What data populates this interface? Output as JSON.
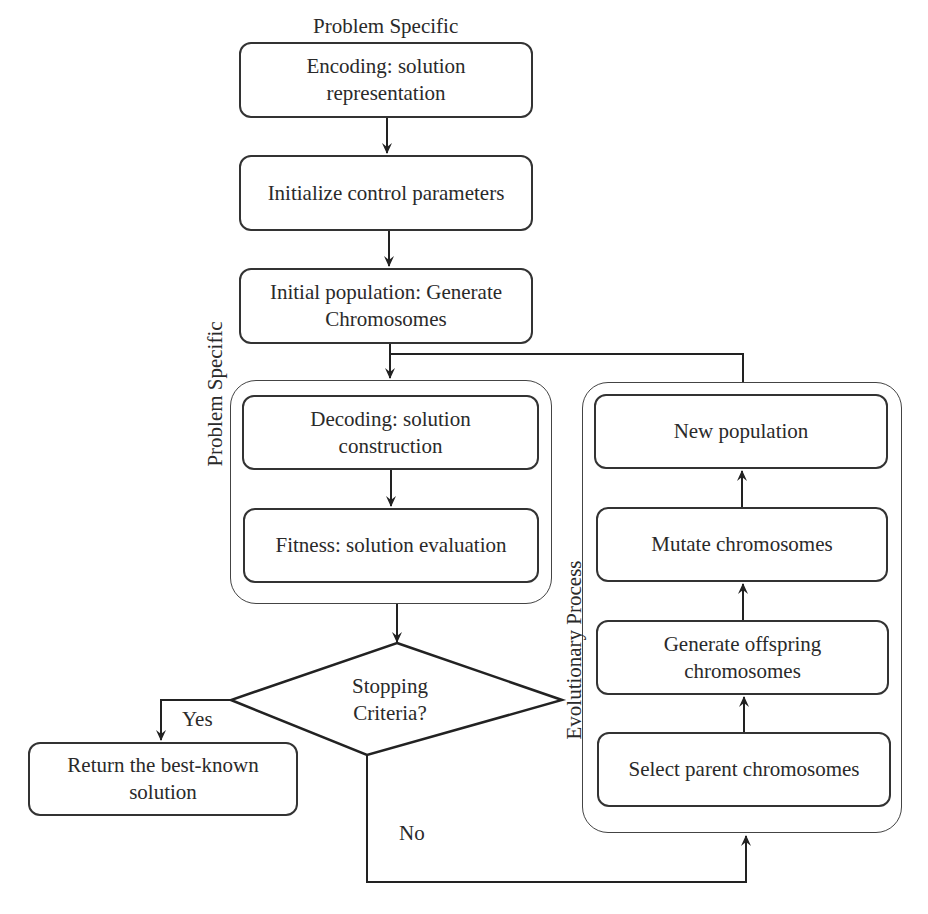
{
  "diagram": {
    "type": "flowchart",
    "title_label": "Problem Specific",
    "nodes": {
      "encoding": "Encoding: solution representation",
      "encoding_line1": "Encoding: solution",
      "encoding_line2": "representation",
      "initialize": "Initialize control parameters",
      "initial_population_line1": "Initial population: Generate",
      "initial_population_line2": "Chromosomes",
      "decoding_line1": "Decoding: solution",
      "decoding_line2": "construction",
      "fitness": "Fitness: solution evaluation",
      "decision_line1": "Stopping",
      "decision_line2": "Criteria?",
      "return_line1": "Return the best-known",
      "return_line2": "solution",
      "new_population": "New population",
      "mutate": "Mutate chromosomes",
      "generate_offspring_line1": "Generate offspring",
      "generate_offspring_line2": "chromosomes",
      "select_parents": "Select parent chromosomes"
    },
    "groups": {
      "problem_specific": "Problem Specific",
      "evolutionary_process": "Evolutionary Process"
    },
    "edge_labels": {
      "yes": "Yes",
      "no": "No"
    },
    "edges": [
      [
        "encoding",
        "initialize"
      ],
      [
        "initialize",
        "initial_population"
      ],
      [
        "initial_population",
        "decoding"
      ],
      [
        "decoding",
        "fitness"
      ],
      [
        "fitness",
        "decision"
      ],
      [
        "decision",
        "return",
        "Yes"
      ],
      [
        "decision",
        "select_parents",
        "No"
      ],
      [
        "select_parents",
        "generate_offspring"
      ],
      [
        "generate_offspring",
        "mutate"
      ],
      [
        "mutate",
        "new_population"
      ],
      [
        "new_population",
        "decoding"
      ]
    ]
  }
}
